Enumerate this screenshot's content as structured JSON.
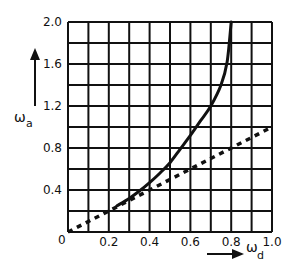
{
  "chart_data": {
    "type": "line",
    "title": "",
    "xlabel": "ω_d",
    "ylabel": "ω_a",
    "xlim": [
      0,
      1.0
    ],
    "ylim": [
      0,
      2.0
    ],
    "grid": true,
    "grid_x_step": 0.1,
    "grid_y_step": 0.2,
    "x_ticks": [
      "0",
      "0.2",
      "0.4",
      "0.6",
      "0.8",
      "1.0"
    ],
    "y_ticks": [
      "0.4",
      "0.8",
      "1.2",
      "1.6",
      "2.0"
    ],
    "origin_label": "0",
    "legend": null,
    "series": [
      {
        "name": "ω_a (solid curve)",
        "style": "solid",
        "x": [
          0.24,
          0.3,
          0.35,
          0.4,
          0.45,
          0.5,
          0.55,
          0.6,
          0.65,
          0.7,
          0.75,
          0.78,
          0.8
        ],
        "y": [
          0.25,
          0.32,
          0.39,
          0.47,
          0.56,
          0.66,
          0.79,
          0.92,
          1.06,
          1.2,
          1.4,
          1.62,
          2.0
        ]
      },
      {
        "name": "ω_a = ω_d (dashed line)",
        "style": "dashed",
        "x": [
          0.0,
          1.0
        ],
        "y": [
          0.0,
          1.0
        ]
      }
    ]
  },
  "labels": {
    "x_axis_symbol": "ω",
    "x_axis_subscript": "d",
    "y_axis_symbol": "ω",
    "y_axis_subscript": "a"
  },
  "colors": {
    "ink": "#111111",
    "background": "#ffffff"
  }
}
